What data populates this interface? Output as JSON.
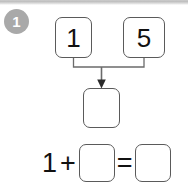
{
  "worksheet": {
    "problem_number": "1",
    "top_band": {
      "color": "#bdbdbd"
    },
    "badge": {
      "color": "#a9a9a9",
      "text_color": "#ffffff"
    }
  },
  "addends": {
    "left_box_value": "1",
    "right_box_value": "5"
  },
  "sum_box": {
    "value": ""
  },
  "connector": {
    "arrow_color": "#6b6b6b",
    "line_color": "#6b6b6b"
  },
  "equation": {
    "first_operand": "1",
    "plus_sign": "+",
    "second_operand": "",
    "equals_sign": "=",
    "result": ""
  },
  "style": {
    "box_border_color": "#5a5a5a",
    "text_color": "#111111",
    "background": "#ffffff"
  }
}
